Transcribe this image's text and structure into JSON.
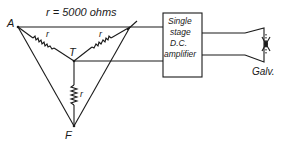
{
  "diagram": {
    "resistance_label": "r = 5000 ohms",
    "nodes": {
      "a": "A",
      "l": "L",
      "t": "T",
      "f": "F"
    },
    "resistor_label": "r",
    "amplifier": {
      "lines": [
        "Single",
        "stage",
        "D.C.",
        "amplifier"
      ]
    },
    "galvanometer_label": "Galv."
  }
}
